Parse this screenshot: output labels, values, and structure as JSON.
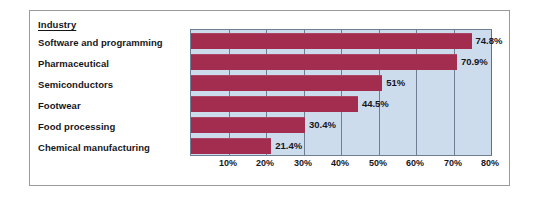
{
  "chart_data": {
    "type": "bar",
    "orientation": "horizontal",
    "title": "",
    "xlabel": "",
    "ylabel": "Industry",
    "categories": [
      "Software and programming",
      "Pharmaceutical",
      "Semiconductors",
      "Footwear",
      "Food processing",
      "Chemical manufacturing"
    ],
    "values": [
      74.8,
      70.9,
      51,
      44.5,
      30.4,
      21.4
    ],
    "value_labels": [
      "74.8%",
      "70.9%",
      "51%",
      "44.5%",
      "30.4%",
      "21.4%"
    ],
    "xlim": [
      0,
      80
    ],
    "xticks": [
      10,
      20,
      30,
      40,
      50,
      60,
      70,
      80
    ],
    "xtick_labels": [
      "10%",
      "20%",
      "30%",
      "40%",
      "50%",
      "60%",
      "70%",
      "80%"
    ],
    "grid": true,
    "legend": false,
    "colors": {
      "bar": "#a32d4e",
      "plot_background": "#cddcec",
      "gridline": "#5d6d84",
      "plot_border": "#6f7f93",
      "frame_border": "#9a9a9a",
      "text": "#16161d",
      "page_background": "#ffffff"
    }
  },
  "header": {
    "label": "Industry"
  }
}
